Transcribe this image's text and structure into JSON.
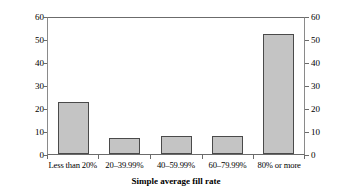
{
  "chart_data": {
    "type": "bar",
    "title": "",
    "categories": [
      "Less than 20%",
      "20–39.99%",
      "40–59.99%",
      "60–79.99%",
      "80% or more"
    ],
    "values": [
      23,
      7,
      8,
      8,
      53
    ],
    "series": [
      {
        "name": "% of number of tariff quotas",
        "values": [
          23,
          7,
          8,
          8,
          53
        ]
      }
    ],
    "xlabel": "Simple average fill rate",
    "ylabel": "% of number of tariff quotas",
    "ylabel_right": "",
    "ylim": [
      0,
      60
    ],
    "yticks": [
      0,
      10,
      20,
      30,
      40,
      50,
      60
    ],
    "ytick_labels": [
      "0",
      "10",
      "20",
      "30",
      "40",
      "50",
      "60"
    ],
    "right_axis": true,
    "right_ytick_labels": [
      "0",
      "10",
      "20",
      "30",
      "40",
      "50",
      "60"
    ],
    "grid": false,
    "legend": null,
    "bar_fill_color": "#c4c4c4",
    "bar_edge_color": "#4a4a4a",
    "axis_color": "#6b6b6b",
    "background_color": "#ffffff"
  },
  "figure": {
    "top_fragment": "",
    "axis_title_x": "Simple average fill rate",
    "axis_title_y": "% of number of tariff quotas"
  }
}
